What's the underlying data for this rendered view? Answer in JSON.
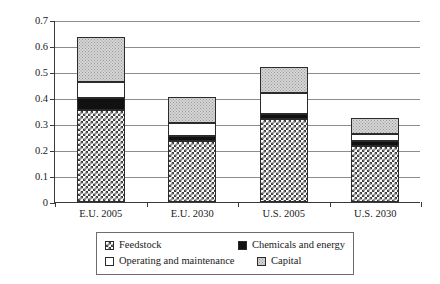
{
  "chart_data": {
    "type": "bar",
    "subtype": "stacked-bar",
    "title": "",
    "xlabel": "",
    "ylabel": "Cost ($/liter diesel equivalent)",
    "categories": [
      "E.U. 2005",
      "E.U. 2030",
      "U.S. 2005",
      "U.S. 2030"
    ],
    "series": [
      {
        "name": "Feedstock",
        "values": [
          0.355,
          0.235,
          0.32,
          0.215
        ]
      },
      {
        "name": "Chemicals and energy",
        "values": [
          0.045,
          0.02,
          0.02,
          0.02
        ]
      },
      {
        "name": "Operating and maintenance",
        "values": [
          0.06,
          0.05,
          0.08,
          0.025
        ]
      },
      {
        "name": "Capital",
        "values": [
          0.175,
          0.1,
          0.1,
          0.065
        ]
      }
    ],
    "totals": [
      0.635,
      0.405,
      0.52,
      0.325
    ],
    "ylim": [
      0,
      0.7
    ],
    "yticks": [
      0,
      0.1,
      0.2,
      0.3,
      0.4,
      0.5,
      0.6,
      0.7
    ],
    "ytick_labels": [
      "0",
      "0.1",
      "0.2",
      "0.3",
      "0.4",
      "0.5",
      "0.6",
      "0.7"
    ],
    "grid": true,
    "grid_axis": "y",
    "legend": {
      "position": "bottom",
      "entries": [
        {
          "label": "Feedstock",
          "swatch": "checkerboard-dark"
        },
        {
          "label": "Chemicals and energy",
          "swatch": "solid-black"
        },
        {
          "label": "Operating and maintenance",
          "swatch": "solid-white"
        },
        {
          "label": "Capital",
          "swatch": "dotted-gray"
        }
      ]
    },
    "colors": {
      "feedstock": "#3d3d3d",
      "chemicals": "#111111",
      "operating_and_maintenance": "#ffffff",
      "capital": "#d5d5d5",
      "axis": "#3a3a3a",
      "gridline": "#8d8d8d",
      "background": "#ffffff"
    }
  }
}
